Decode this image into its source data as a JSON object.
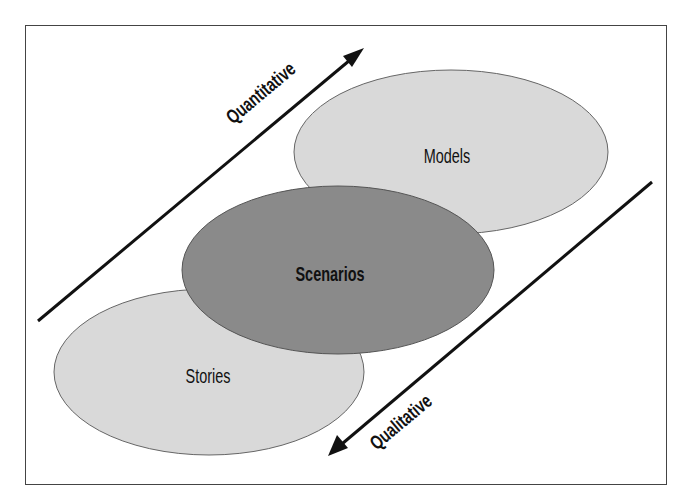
{
  "diagram": {
    "type": "overlapping-ellipses",
    "nodes": [
      {
        "id": "models",
        "label": "Models",
        "fill": "#d9d9d9",
        "cx": 451,
        "cy": 152,
        "rx": 157,
        "ry": 82
      },
      {
        "id": "stories",
        "label": "Stories",
        "fill": "#d9d9d9",
        "cx": 209,
        "cy": 372,
        "rx": 155,
        "ry": 83
      },
      {
        "id": "scenarios",
        "label": "Scenarios",
        "fill": "#8a8a8a",
        "cx": 338,
        "cy": 270,
        "rx": 156,
        "ry": 84
      }
    ],
    "arrows": [
      {
        "id": "quantitative",
        "label": "Quantitative",
        "direction": "up-right"
      },
      {
        "id": "qualitative",
        "label": "Qualitative",
        "direction": "down-left"
      }
    ]
  },
  "labels": {
    "models": "Models",
    "stories": "Stories",
    "scenarios": "Scenarios",
    "quantitative": "Quantitative",
    "qualitative": "Qualitative"
  },
  "colors": {
    "light_ellipse": "#d9d9d9",
    "dark_ellipse": "#8a8a8a",
    "stroke": "#555555",
    "arrow": "#111111"
  }
}
